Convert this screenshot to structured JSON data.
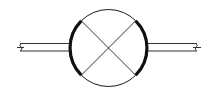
{
  "diagram": {
    "type": "symbol",
    "description": "Circle with X (crossed lines) and thickened side arcs, connected to pipe stubs on left and right with break marks",
    "colors": {
      "background": "#ffffff",
      "stroke": "#1a1a1a",
      "pipe_stroke": "#333333"
    },
    "circle": {
      "cx": 108.5,
      "cy": 48,
      "r": 38.5
    },
    "cross": {
      "lines": [
        {
          "x1": 81,
          "y1": 21,
          "x2": 136,
          "y2": 75
        },
        {
          "x1": 81,
          "y1": 75,
          "x2": 136,
          "y2": 21
        }
      ]
    },
    "thick_arcs": [
      "left",
      "right"
    ],
    "pipes": {
      "left": {
        "x_start": 17,
        "x_end": 70,
        "y_top": 43.5,
        "y_bottom": 51,
        "break_mark": true
      },
      "right": {
        "x_start": 147,
        "x_end": 200,
        "y_top": 43.5,
        "y_bottom": 51,
        "break_mark": true
      }
    }
  }
}
